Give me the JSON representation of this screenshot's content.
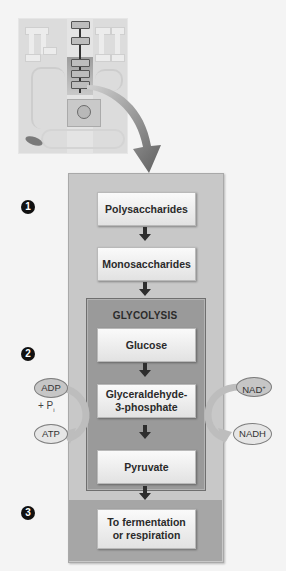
{
  "diagram": {
    "thumbnail": {
      "label": "metabolic-map-thumbnail"
    },
    "markers": [
      "1",
      "2",
      "3"
    ],
    "steps": [
      {
        "label": "Polysaccharides"
      },
      {
        "label": "Monosaccharides"
      },
      {
        "label": "Glucose"
      },
      {
        "label": "Glyceraldehyde-\n3-phosphate"
      },
      {
        "label": "Pyruvate"
      },
      {
        "label": "To fermentation\nor respiration"
      }
    ],
    "glycolysis_label": "GLYCOLYSIS",
    "side_left": {
      "input": "ADP",
      "plus": "+ P",
      "sub": "i",
      "output": "ATP"
    },
    "side_right": {
      "input": "NAD",
      "sup": "+",
      "output": "NADH"
    },
    "colors": {
      "outer_panel": "#c8c8c8",
      "glycolysis_panel": "#9a9a9a",
      "section3_panel": "#a6a6a6",
      "step_box": "#f0f0f0",
      "arrow": "#333333"
    }
  }
}
